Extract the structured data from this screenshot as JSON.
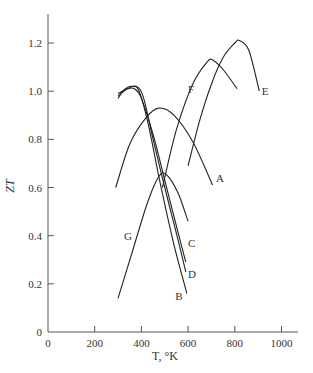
{
  "chart_data": {
    "type": "line",
    "title": "",
    "xlabel": "T, °K",
    "ylabel": "ZT",
    "xlim": [
      0,
      1000
    ],
    "ylim": [
      0,
      1.3
    ],
    "x_ticks": [
      0,
      200,
      400,
      600,
      800,
      1000
    ],
    "x_tick_labels": [
      "0",
      "200",
      "400",
      "600",
      "800",
      "1000"
    ],
    "y_ticks": [
      0,
      0.2,
      0.4,
      0.6,
      0.8,
      1.0,
      1.2
    ],
    "y_tick_labels": [
      "0",
      "0.2",
      "0.4",
      "0.6",
      "0.8",
      "1.0",
      "1.2"
    ],
    "grid": false,
    "legend": "inline curve labels",
    "series": [
      {
        "name": "A",
        "x": [
          290,
          350,
          420,
          475,
          540,
          620,
          705
        ],
        "y": [
          0.6,
          0.78,
          0.89,
          0.93,
          0.9,
          0.79,
          0.61
        ]
      },
      {
        "name": "B",
        "x": [
          300,
          330,
          360,
          390,
          430,
          480,
          540,
          595
        ],
        "y": [
          0.97,
          1.01,
          1.02,
          1.0,
          0.86,
          0.62,
          0.36,
          0.16
        ]
      },
      {
        "name": "C",
        "x": [
          300,
          340,
          370,
          400,
          450,
          500,
          550,
          590
        ],
        "y": [
          0.99,
          1.01,
          1.01,
          0.97,
          0.82,
          0.63,
          0.44,
          0.29
        ]
      },
      {
        "name": "D",
        "x": [
          300,
          340,
          380,
          410,
          450,
          500,
          550,
          590
        ],
        "y": [
          0.98,
          1.01,
          1.02,
          0.97,
          0.8,
          0.6,
          0.41,
          0.25
        ]
      },
      {
        "name": "E",
        "x": [
          600,
          650,
          700,
          750,
          800,
          820,
          860,
          905
        ],
        "y": [
          0.69,
          0.88,
          1.03,
          1.14,
          1.2,
          1.21,
          1.17,
          1.0
        ]
      },
      {
        "name": "F",
        "x": [
          490,
          550,
          620,
          680,
          705,
          750,
          810
        ],
        "y": [
          0.6,
          0.84,
          1.03,
          1.12,
          1.13,
          1.09,
          1.01
        ]
      },
      {
        "name": "G",
        "x": [
          300,
          360,
          420,
          460,
          490,
          520,
          560,
          600
        ],
        "y": [
          0.14,
          0.33,
          0.52,
          0.62,
          0.66,
          0.64,
          0.57,
          0.46
        ]
      }
    ],
    "labels": [
      {
        "text": "A",
        "x": 720,
        "y": 0.64
      },
      {
        "text": "B",
        "x": 545,
        "y": 0.15
      },
      {
        "text": "C",
        "x": 600,
        "y": 0.37
      },
      {
        "text": "D",
        "x": 600,
        "y": 0.24
      },
      {
        "text": "E",
        "x": 915,
        "y": 1.0
      },
      {
        "text": "F",
        "x": 600,
        "y": 1.01
      },
      {
        "text": "G",
        "x": 325,
        "y": 0.4
      }
    ]
  },
  "axes": {
    "xlabel": "T, °K",
    "ylabel": "ZT"
  }
}
